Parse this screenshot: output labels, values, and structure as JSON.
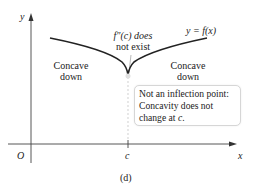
{
  "figure": {
    "caption": "(d)",
    "axes": {
      "x_label": "x",
      "y_label": "y",
      "origin_label": "O",
      "tick_label": "c"
    },
    "curve_label": "y = f(x)",
    "annotation_top": {
      "line1": "f″(c) does",
      "line2": "not exist"
    },
    "left_region": {
      "line1": "Concave",
      "line2": "down"
    },
    "right_region": {
      "line1": "Concave",
      "line2": "down"
    },
    "note": {
      "line1": "Not an inflection point:",
      "line2": "Concavity does not",
      "line3_prefix": "change at ",
      "line3_var": "c",
      "line3_suffix": "."
    }
  }
}
